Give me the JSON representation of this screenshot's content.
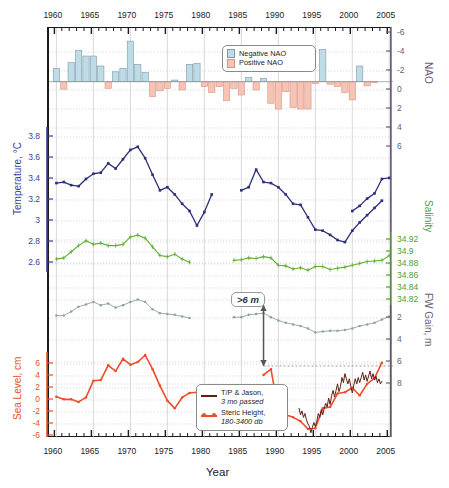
{
  "figure": {
    "xlabel": "Year",
    "x_range": [
      1959,
      2005.5
    ],
    "x_major_ticks": [
      1960,
      1965,
      1970,
      1975,
      1980,
      1985,
      1990,
      1995,
      2000,
      2005
    ],
    "x_minor_step": 1,
    "top_axis_labels": [
      "1960",
      "1965",
      "1970",
      "1975",
      "1980",
      "1985",
      "1990",
      "1995",
      "2000",
      "2005"
    ],
    "bottom_axis_labels": [
      "1960",
      "1965",
      "1970",
      "1975",
      "1980",
      "1985",
      "1990",
      "1995",
      "2000",
      "2005"
    ],
    "axes": {
      "nao": {
        "title": "NAO",
        "side": "right",
        "ticks": [
          -6,
          -4,
          -2,
          0,
          2,
          4,
          6
        ],
        "labels": [
          "-6",
          "-4",
          "-2",
          "0",
          "2",
          "4",
          "6"
        ],
        "inverted": true,
        "color": "#6b5a7d"
      },
      "temp": {
        "title": "Temperature, °C",
        "side": "left",
        "ticks": [
          2.6,
          2.8,
          3,
          3.2,
          3.4,
          3.6,
          3.8
        ],
        "labels": [
          "2.6",
          "2.8",
          "3",
          "3.2",
          "3.4",
          "3.6",
          "3.8"
        ],
        "inverted": false,
        "color": "#3a3f8f"
      },
      "sal": {
        "title": "Salinity",
        "side": "right",
        "ticks": [
          34.82,
          34.84,
          34.86,
          34.88,
          34.9,
          34.92
        ],
        "labels": [
          "34.82",
          "34.84",
          "34.86",
          "34.88",
          "34.9",
          "34.92"
        ],
        "inverted": false,
        "color": "#4f9b3a"
      },
      "fw": {
        "title": "FW Gain, m",
        "side": "right",
        "ticks": [
          2,
          4,
          6,
          8
        ],
        "labels": [
          "2",
          "4",
          "6",
          "8"
        ],
        "inverted": true,
        "color": "#6b6276"
      },
      "sea": {
        "title": "Sea Level, cm",
        "side": "left",
        "ticks": [
          -6,
          -4,
          -2,
          0,
          2,
          4,
          6
        ],
        "labels": [
          "-6",
          "-4",
          "-2",
          "0",
          "2",
          "4",
          "6"
        ],
        "inverted": false,
        "color": "#e8502a"
      }
    },
    "annotation": {
      "text": ">6 m",
      "arrow": "double-vertical",
      "x_year": 1988
    }
  },
  "legends": {
    "nao": {
      "entries": [
        {
          "label": "Negative NAO",
          "fill": "#bfdbe8",
          "stroke": "#7d9aa8",
          "icon": "square-swatch"
        },
        {
          "label": "Positive NAO",
          "fill": "#f7c3b4",
          "stroke": "#d79482",
          "icon": "square-swatch"
        }
      ]
    },
    "sealevel": {
      "entries": [
        {
          "label": "T/P & Jason,",
          "sublabel": "3 mo passed",
          "color": "#5e1f14",
          "icon": "line-swatch",
          "marker": false
        },
        {
          "label": "Steric Height,",
          "sublabel": "180-3400 db",
          "color": "#ef4b2c",
          "icon": "line-marker-swatch",
          "marker": true
        }
      ]
    }
  },
  "chart_data": [
    {
      "type": "bar",
      "name": "NAO Index",
      "title": "NAO",
      "xlabel": "Year",
      "ylabel": "NAO",
      "ylim": [
        8,
        -6
      ],
      "y_inverted": true,
      "grid": true,
      "legend_position": "top-center",
      "colors": {
        "negative": "#bfdbe8",
        "positive": "#f7c3b4",
        "negative_edge": "#7d9aa8",
        "positive_edge": "#d79482"
      },
      "x": [
        1960,
        1961,
        1962,
        1963,
        1964,
        1965,
        1966,
        1967,
        1968,
        1969,
        1970,
        1971,
        1972,
        1973,
        1974,
        1975,
        1976,
        1977,
        1978,
        1979,
        1980,
        1981,
        1982,
        1983,
        1984,
        1985,
        1986,
        1987,
        1988,
        1989,
        1990,
        1991,
        1992,
        1993,
        1994,
        1995,
        1996,
        1997,
        1998,
        1999,
        2000,
        2001,
        2002,
        2003,
        2004,
        2005
      ],
      "values": [
        -1.6,
        0.9,
        -2.3,
        -3.8,
        -3.1,
        -3.1,
        -1.9,
        0.8,
        -1.2,
        -1.6,
        -4.9,
        -2.1,
        -1.1,
        1.8,
        1.1,
        0.8,
        -0.2,
        1.0,
        -2.1,
        -2.2,
        0.6,
        1.3,
        0.6,
        2.3,
        0.8,
        1.6,
        -0.5,
        1.0,
        -0.4,
        2.6,
        3.3,
        1.2,
        3.1,
        3.3,
        3.3,
        0.2,
        -3.9,
        0.3,
        0.6,
        1.3,
        2.2,
        -1.9,
        0.5,
        0.1,
        0.0,
        0.0
      ]
    },
    {
      "type": "line",
      "name": "Temperature",
      "ylabel": "Temperature, °C",
      "ylim": [
        2.5,
        3.9
      ],
      "color": "#2c2f7a",
      "marker": "square",
      "errorbars": true,
      "segments": [
        {
          "x": [
            1960,
            1961,
            1962,
            1963,
            1964,
            1965,
            1966,
            1967,
            1968,
            1969,
            1970,
            1971,
            1972,
            1973,
            1974,
            1975,
            1976,
            1977,
            1978,
            1979,
            1980,
            1981
          ],
          "y": [
            3.32,
            3.33,
            3.3,
            3.29,
            3.36,
            3.41,
            3.42,
            3.51,
            3.46,
            3.55,
            3.64,
            3.67,
            3.56,
            3.4,
            3.25,
            3.28,
            3.21,
            3.12,
            3.05,
            2.91,
            3.04,
            3.21
          ]
        },
        {
          "x": [
            1985,
            1986,
            1987,
            1988,
            1989,
            1990,
            1991,
            1992,
            1993,
            1994,
            1995,
            1996,
            1997,
            1998,
            1999,
            2000,
            2001,
            2002,
            2003,
            2004
          ],
          "y": [
            3.25,
            3.28,
            3.45,
            3.33,
            3.32,
            3.28,
            3.21,
            3.12,
            3.11,
            2.99,
            2.87,
            2.86,
            2.82,
            2.77,
            2.75,
            2.86,
            2.94,
            3.01,
            3.08,
            3.15
          ]
        },
        {
          "x": [
            2000,
            2001,
            2002,
            2003,
            2004,
            2005
          ],
          "y": [
            3.05,
            3.1,
            3.17,
            3.22,
            3.36,
            3.37
          ]
        }
      ]
    },
    {
      "type": "line",
      "name": "Salinity",
      "ylabel": "Salinity",
      "ylim": [
        34.8,
        34.935
      ],
      "color": "#5fb032",
      "marker": "plus",
      "errorbars": true,
      "segments": [
        {
          "x": [
            1960,
            1961,
            1962,
            1963,
            1964,
            1965,
            1966,
            1967,
            1968,
            1969,
            1970,
            1971,
            1972,
            1973,
            1974,
            1975,
            1976,
            1977,
            1978
          ],
          "y": [
            34.86,
            34.862,
            34.872,
            34.882,
            34.89,
            34.884,
            34.886,
            34.882,
            34.882,
            34.884,
            34.896,
            34.899,
            34.894,
            34.88,
            34.866,
            34.864,
            34.868,
            34.86,
            34.855,
            34.856
          ]
        },
        {
          "x": [
            1984,
            1985,
            1986,
            1987,
            1988,
            1989,
            1990,
            1991,
            1992,
            1993,
            1994,
            1995,
            1996,
            1997,
            1998,
            1999,
            2000,
            2001,
            2002,
            2003,
            2004,
            2005
          ],
          "y": [
            34.858,
            34.859,
            34.862,
            34.861,
            34.864,
            34.862,
            34.85,
            34.849,
            34.844,
            34.846,
            34.842,
            34.848,
            34.848,
            34.843,
            34.845,
            34.847,
            34.85,
            34.853,
            34.856,
            34.857,
            34.858,
            34.866
          ]
        }
      ]
    },
    {
      "type": "line",
      "name": "FW Gain",
      "ylabel": "FW Gain, m",
      "ylim": [
        9.2,
        0.2
      ],
      "y_inverted": true,
      "color": "#8fa39b",
      "marker": "dot",
      "segments": [
        {
          "x": [
            1960,
            1961,
            1962,
            1963,
            1964,
            1965,
            1966,
            1967,
            1968,
            1969,
            1970,
            1971,
            1972,
            1973,
            1974,
            1975,
            1976,
            1977,
            1978
          ],
          "y": [
            3.9,
            3.9,
            3.4,
            2.8,
            2.5,
            2.2,
            2.6,
            2.4,
            2.9,
            2.6,
            2.2,
            1.9,
            2.2,
            3.1,
            3.6,
            3.7,
            3.8,
            4.0,
            4.2
          ]
        },
        {
          "x": [
            1984,
            1985,
            1986,
            1987,
            1988,
            1989,
            1990,
            1991,
            1992,
            1993,
            1994,
            1995,
            1996,
            1997,
            1998,
            1999,
            2000,
            2001,
            2002,
            2003,
            2004,
            2005
          ],
          "y": [
            4.1,
            4.1,
            3.8,
            3.7,
            3.6,
            4.1,
            4.5,
            4.8,
            5.0,
            5.2,
            5.5,
            6.0,
            5.9,
            5.8,
            5.8,
            5.7,
            5.5,
            5.2,
            5.0,
            4.8,
            4.4,
            4.0
          ]
        }
      ]
    },
    {
      "type": "line",
      "name": "Steric Height, 180-3400 db",
      "ylabel": "Sea Level, cm",
      "ylim": [
        -6.5,
        7.5
      ],
      "color": "#ef4b2c",
      "marker": "dot",
      "segments": [
        {
          "x": [
            1960,
            1961,
            1962,
            1963,
            1964,
            1965,
            1966,
            1967,
            1968,
            1969,
            1970,
            1971,
            1972,
            1973,
            1974,
            1975,
            1976,
            1977,
            1978,
            1979,
            1980,
            1981
          ],
          "y": [
            -0.4,
            -0.8,
            -0.8,
            -1.2,
            -0.5,
            2.1,
            2.2,
            4.5,
            3.6,
            5.5,
            4.6,
            5.0,
            6.1,
            3.9,
            1.3,
            -1.0,
            -2.2,
            -0.5,
            0.2,
            0.3,
            0.6,
            0.8
          ]
        },
        {
          "x": [
            1988,
            1989,
            1990,
            1991,
            1992,
            1993,
            1994,
            1995,
            1996,
            1997,
            1998,
            1999,
            2000,
            2001,
            2002,
            2003,
            2004
          ],
          "y": [
            3.0,
            3.9,
            -2.5,
            -3.2,
            -3.6,
            -4.2,
            -5.4,
            -5.3,
            -2.2,
            -2.0,
            0.1,
            0.3,
            1.0,
            -0.2,
            1.6,
            2.5,
            4.9
          ]
        }
      ]
    },
    {
      "type": "line",
      "name": "T/P & Jason, 3 mo passed",
      "ylabel": "Sea Level, cm",
      "ylim": [
        -6.5,
        7.5
      ],
      "color": "#5e1f14",
      "marker": "none",
      "segments": [
        {
          "x": [
            1992.8,
            1993.0,
            1993.2,
            1993.4,
            1993.6,
            1993.8,
            1994.0,
            1994.2,
            1994.4,
            1994.6,
            1994.8,
            1995.0,
            1995.2,
            1995.4,
            1995.6,
            1995.8,
            1996.0,
            1996.2,
            1996.4,
            1996.6,
            1996.8,
            1997.0,
            1997.2,
            1997.4,
            1997.6,
            1997.8,
            1998.0,
            1998.2,
            1998.4,
            1998.6,
            1998.8,
            1999.0,
            1999.2,
            1999.4,
            1999.6,
            1999.8,
            2000.0,
            2000.2,
            2000.4,
            2000.6,
            2000.8,
            2001.0,
            2001.2,
            2001.4,
            2001.6,
            2001.8,
            2002.0,
            2002.2,
            2002.4,
            2002.6,
            2002.8,
            2003.0,
            2003.2,
            2003.4,
            2003.6,
            2003.8,
            2004.0
          ],
          "y": [
            -2.2,
            -3.2,
            -2.6,
            -3.6,
            -3.0,
            -4.0,
            -4.6,
            -5.0,
            -6.0,
            -5.2,
            -4.4,
            -5.0,
            -4.2,
            -3.0,
            -3.6,
            -2.4,
            -3.2,
            -2.2,
            -1.4,
            -2.0,
            -0.6,
            -1.6,
            -0.2,
            0.6,
            -0.4,
            0.6,
            1.6,
            0.4,
            1.2,
            2.6,
            1.8,
            3.2,
            2.4,
            1.6,
            2.4,
            1.2,
            0.2,
            1.4,
            2.4,
            1.6,
            2.6,
            1.8,
            2.6,
            3.4,
            2.2,
            3.0,
            2.0,
            2.8,
            3.6,
            2.4,
            3.2,
            2.2,
            2.8,
            1.8,
            2.4,
            1.6,
            2.0
          ]
        }
      ]
    }
  ]
}
